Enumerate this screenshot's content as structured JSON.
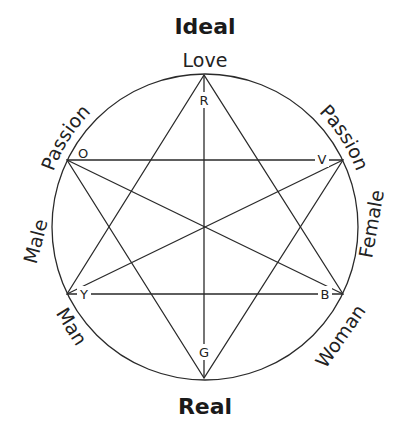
{
  "diagram": {
    "top_title": "Ideal",
    "bottom_title": "Real",
    "ring_labels": {
      "top": "Love",
      "upper_left": "Passion",
      "upper_right": "Passion",
      "left": "Male",
      "right": "Female",
      "lower_left": "Man",
      "lower_right": "Woman"
    },
    "vertex_labels": {
      "top": "R",
      "bottom": "G",
      "upper_left": "O",
      "upper_right": "V",
      "lower_left": "Y",
      "lower_right": "B"
    },
    "colors": {
      "line": "#2a2a2a",
      "text": "#1a1a1a",
      "background": "#ffffff"
    }
  }
}
